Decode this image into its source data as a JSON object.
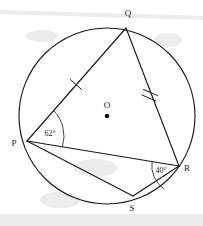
{
  "figure": {
    "type": "circle-geometry-diagram",
    "center_label": "O",
    "vertices": [
      {
        "name": "Q",
        "label": "Q",
        "x": 126,
        "y": 28,
        "label_x": 128,
        "label_y": 15
      },
      {
        "name": "P",
        "label": "P",
        "x": 27,
        "y": 141,
        "label_x": 14,
        "label_y": 146
      },
      {
        "name": "R",
        "label": "R",
        "x": 179,
        "y": 166,
        "label_x": 186,
        "label_y": 171
      },
      {
        "name": "S",
        "label": "S",
        "x": 133,
        "y": 196,
        "label_x": 132,
        "label_y": 210
      }
    ],
    "circle": {
      "cx": 107,
      "cy": 116,
      "r": 88
    },
    "centre_point": {
      "x": 107,
      "y": 116,
      "label_x": 107,
      "label_y": 107
    },
    "segments": [
      {
        "name": "PQ",
        "from": "P",
        "to": "Q",
        "ticks": 1
      },
      {
        "name": "QR",
        "from": "Q",
        "to": "R",
        "ticks": 2
      },
      {
        "name": "PR",
        "from": "P",
        "to": "R",
        "ticks": 0
      },
      {
        "name": "PS",
        "from": "P",
        "to": "S",
        "ticks": 0
      },
      {
        "name": "SR",
        "from": "S",
        "to": "R",
        "ticks": 0
      }
    ],
    "angles": [
      {
        "name": "angle-QPR",
        "vertex": "P",
        "label": "62°",
        "label_x": 50,
        "label_y": 135
      },
      {
        "name": "angle-PRS",
        "vertex": "R",
        "label": "40°",
        "label_x": 160,
        "label_y": 172
      }
    ],
    "colors": {
      "ink": "#1a1a1a",
      "background": "#ffffff",
      "smudge": "#ded9d2"
    }
  }
}
